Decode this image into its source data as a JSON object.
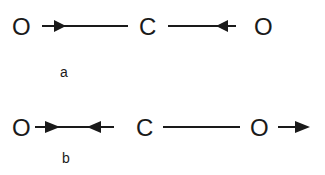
{
  "diagram": {
    "rows": [
      {
        "id": "a",
        "label": "a",
        "atoms": [
          "O",
          "C",
          "O"
        ],
        "arrows": [
          {
            "on": "left-bond",
            "direction": "right"
          },
          {
            "on": "right-bond",
            "direction": "left"
          }
        ]
      },
      {
        "id": "b",
        "label": "b",
        "atoms": [
          "O",
          "C",
          "O"
        ],
        "arrows": [
          {
            "on": "left-bond",
            "direction": "right"
          },
          {
            "on": "left-bond",
            "direction": "left"
          },
          {
            "on": "right-oxygen",
            "direction": "right"
          }
        ]
      }
    ]
  },
  "colors": {
    "ink": "#1a1a1a",
    "background": "#ffffff"
  }
}
